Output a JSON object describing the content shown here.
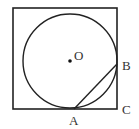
{
  "diagram": {
    "square": {
      "x": 13,
      "y": 8,
      "w": 104,
      "h": 101
    },
    "circle": {
      "cx": 70,
      "cy": 61,
      "r": 47
    },
    "center_label": "O",
    "points": {
      "A": "A",
      "B": "B",
      "C": "C"
    },
    "stroke": "#222"
  }
}
